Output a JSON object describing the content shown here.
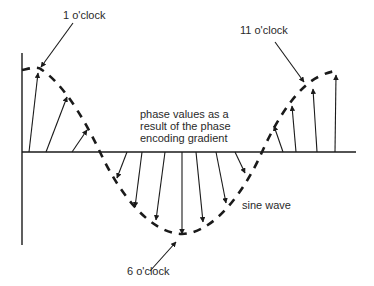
{
  "diagram": {
    "labels": {
      "one_oclock": "1 o'clock",
      "eleven_oclock": "11 o'clock",
      "six_oclock": "6 o'clock",
      "caption": "phase values as a\nresult of the phase\nencoding gradient",
      "sine_wave": "sine wave"
    },
    "colors": {
      "ink": "#1a1a1a",
      "text": "#2a2a2a",
      "background": "#ffffff"
    },
    "axes": {
      "vertical": {
        "x": 22,
        "y1": 53,
        "y2": 245
      },
      "baseline": {
        "y": 152,
        "x1": 22,
        "x2": 356
      }
    },
    "vectors": [
      {
        "x1": 29,
        "y1": 152,
        "x2": 38,
        "y2": 73,
        "direction": "up"
      },
      {
        "x1": 46,
        "y1": 152,
        "x2": 67,
        "y2": 97,
        "direction": "up"
      },
      {
        "x1": 72,
        "y1": 152,
        "x2": 87,
        "y2": 130,
        "direction": "up"
      },
      {
        "x1": 127,
        "y1": 152,
        "x2": 117,
        "y2": 178,
        "direction": "down"
      },
      {
        "x1": 142,
        "y1": 152,
        "x2": 135,
        "y2": 207,
        "direction": "down"
      },
      {
        "x1": 165,
        "y1": 152,
        "x2": 156,
        "y2": 220,
        "direction": "down"
      },
      {
        "x1": 182,
        "y1": 152,
        "x2": 182,
        "y2": 234,
        "direction": "down"
      },
      {
        "x1": 196,
        "y1": 152,
        "x2": 203,
        "y2": 222,
        "direction": "down"
      },
      {
        "x1": 216,
        "y1": 152,
        "x2": 226,
        "y2": 203,
        "direction": "down"
      },
      {
        "x1": 235,
        "y1": 152,
        "x2": 245,
        "y2": 173,
        "direction": "down"
      },
      {
        "x1": 283,
        "y1": 152,
        "x2": 274,
        "y2": 126,
        "direction": "up"
      },
      {
        "x1": 296,
        "y1": 152,
        "x2": 292,
        "y2": 106,
        "direction": "up"
      },
      {
        "x1": 317,
        "y1": 152,
        "x2": 313,
        "y2": 89,
        "direction": "up"
      },
      {
        "x1": 335,
        "y1": 152,
        "x2": 336,
        "y2": 75,
        "direction": "up"
      }
    ],
    "callouts": [
      {
        "name": "one-oclock-pointer",
        "x1": 73,
        "y1": 23,
        "x2": 41,
        "y2": 67
      },
      {
        "name": "eleven-oclock-pointer",
        "x1": 275,
        "y1": 42,
        "x2": 304,
        "y2": 82
      },
      {
        "name": "six-oclock-pointer",
        "x1": 150,
        "y1": 271,
        "x2": 176,
        "y2": 242
      }
    ]
  }
}
